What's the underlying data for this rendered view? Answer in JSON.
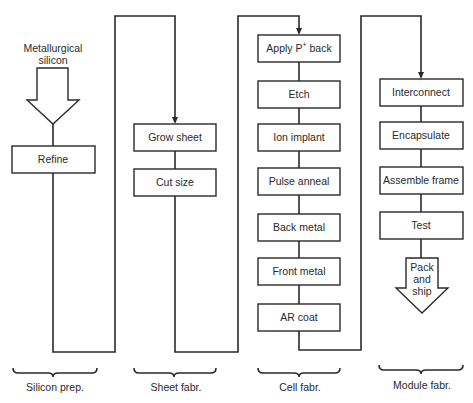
{
  "input_label": [
    "Metallurgical",
    "silicon"
  ],
  "stages": [
    {
      "name": "Silicon prep.",
      "steps": [
        "Refine"
      ]
    },
    {
      "name": "Sheet fabr.",
      "steps": [
        "Grow sheet",
        "Cut size"
      ]
    },
    {
      "name": "Cell fabr.",
      "steps": [
        "Apply P+ back",
        "Etch",
        "Ion implant",
        "Pulse anneal",
        "Back metal",
        "Front metal",
        "AR coat"
      ]
    },
    {
      "name": "Module fabr.",
      "steps": [
        "Interconnect",
        "Encapsulate",
        "Assemble frame",
        "Test"
      ]
    }
  ],
  "cell_first_step": {
    "prefix": "Apply P",
    "superscript": "+",
    "suffix": " back"
  },
  "output_label": [
    "Pack",
    "and",
    "ship"
  ]
}
